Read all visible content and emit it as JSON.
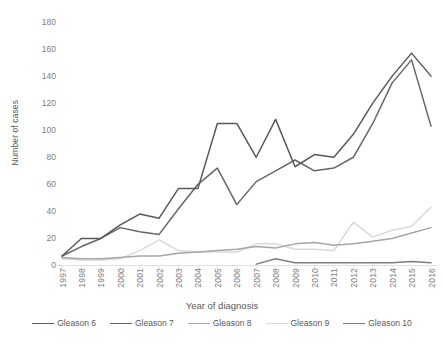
{
  "chart_data": {
    "type": "line",
    "title": "",
    "xlabel": "Year of diagnosis",
    "ylabel": "Number of cases",
    "x": [
      1997,
      1998,
      1999,
      2000,
      2001,
      2002,
      2003,
      2004,
      2005,
      2006,
      2007,
      2008,
      2009,
      2010,
      2011,
      2012,
      2013,
      2014,
      2015,
      2016
    ],
    "xtick_labels": [
      "1997",
      "1998",
      "1999",
      "2000",
      "2001",
      "2002",
      "2003",
      "2004",
      "2005",
      "2006",
      "2007",
      "2008",
      "2009",
      "2010",
      "2011",
      "2012",
      "2013",
      "2014",
      "2015",
      "2016"
    ],
    "ytick_labels": [
      "0",
      "20",
      "40",
      "60",
      "80",
      "100",
      "120",
      "140",
      "160",
      "180"
    ],
    "ylim": [
      0,
      180
    ],
    "ytick_step": 20,
    "grid": false,
    "legend_position": "bottom",
    "series": [
      {
        "name": "Gleason 6",
        "color": "#595959",
        "values": [
          7,
          20,
          20,
          30,
          38,
          35,
          57,
          57,
          105,
          105,
          80,
          108,
          73,
          82,
          80,
          97,
          120,
          140,
          157,
          140
        ]
      },
      {
        "name": "Gleason 7",
        "color": "#666666",
        "values": [
          7,
          14,
          20,
          28,
          25,
          23,
          42,
          60,
          72,
          45,
          62,
          70,
          78,
          70,
          72,
          80,
          105,
          135,
          152,
          103
        ]
      },
      {
        "name": "Gleason 8",
        "color": "#a6a6a6",
        "values": [
          6,
          5,
          5,
          6,
          7,
          7,
          9,
          10,
          11,
          12,
          14,
          13,
          16,
          17,
          15,
          16,
          18,
          20,
          24,
          28
        ]
      },
      {
        "name": "Gleason 9",
        "color": "#d9d9d9",
        "values": [
          5,
          4,
          4,
          5,
          11,
          19,
          11,
          10,
          10,
          10,
          16,
          16,
          12,
          12,
          11,
          32,
          21,
          26,
          29,
          43
        ]
      },
      {
        "name": "Gleason 10",
        "color": "#7f7f7f",
        "values": [
          null,
          null,
          null,
          null,
          null,
          null,
          null,
          null,
          null,
          null,
          1,
          5,
          2,
          2,
          2,
          2,
          2,
          2,
          3,
          2
        ]
      }
    ]
  },
  "legend": {
    "items": [
      {
        "label": "Gleason 6"
      },
      {
        "label": "Gleason 7"
      },
      {
        "label": "Gleason 8"
      },
      {
        "label": "Gleason 9"
      },
      {
        "label": "Gleason 10"
      }
    ]
  }
}
